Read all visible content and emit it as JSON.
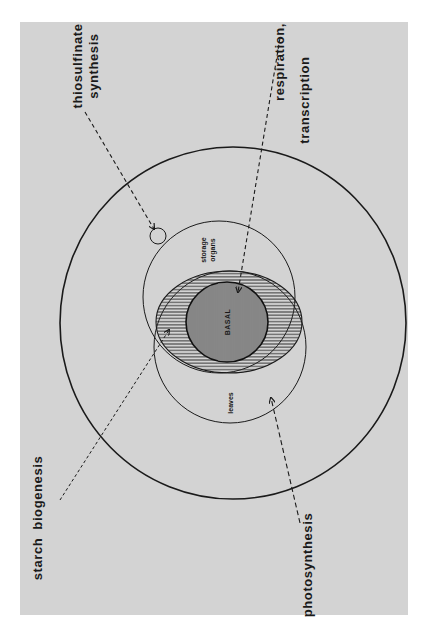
{
  "figure": {
    "background_color": "#d3d3d3",
    "line_color": "#1a1a1a",
    "orientation": "rotated 90deg counter-clockwise"
  },
  "regions": {
    "outer": {
      "label": ""
    },
    "storage_organs": {
      "label_line1": "storage",
      "label_line2": "organs"
    },
    "leaves": {
      "label": "leaves"
    },
    "basal": {
      "label": "BASAL"
    },
    "overlap": {
      "label": ""
    },
    "small_site": {
      "label": ""
    }
  },
  "annotations": {
    "thiosulfinate": {
      "line1": "thiosulfinate",
      "line2": "synthesis"
    },
    "respiration": {
      "line1": "respiration,",
      "line2": "transcription"
    },
    "starch": {
      "line1": "starch",
      "line2": "biogenesis"
    },
    "photosynthesis": {
      "line1": "photosynthesis"
    }
  }
}
